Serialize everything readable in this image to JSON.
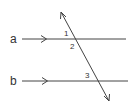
{
  "diagram": {
    "type": "parallel-lines-transversal",
    "line_color": "#444444",
    "text_color": "#333333",
    "lines": [
      {
        "name": "a",
        "label": "a",
        "parallel_marker": ">"
      },
      {
        "name": "b",
        "label": "b",
        "parallel_marker": ">"
      }
    ],
    "transversal": {
      "arrows": "both-ends"
    },
    "angles": [
      {
        "id": "1",
        "label": "1",
        "position": "above line a, left of transversal"
      },
      {
        "id": "2",
        "label": "2",
        "position": "below line a, right of transversal"
      },
      {
        "id": "3",
        "label": "3",
        "position": "above line b, left of transversal"
      }
    ]
  }
}
